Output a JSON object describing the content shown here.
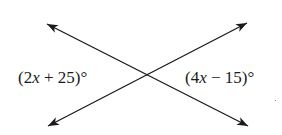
{
  "diagram": {
    "type": "vertical-angles",
    "stroke_color": "#1a1a1a",
    "lines": [
      {
        "name": "line-1",
        "x1": 47,
        "y1": 24,
        "x2": 248,
        "y2": 126
      },
      {
        "name": "line-2",
        "x1": 247,
        "y1": 23,
        "x2": 48,
        "y2": 126
      }
    ],
    "intersection": {
      "x": 147,
      "y": 75
    },
    "labels": {
      "left": {
        "open": "(2",
        "var": "x",
        "rest": " + 25)°",
        "full": "(2x + 25)°"
      },
      "right": {
        "open": "(4",
        "var": "x",
        "rest": " − 15)°",
        "full": "(4x − 15)°"
      }
    }
  }
}
